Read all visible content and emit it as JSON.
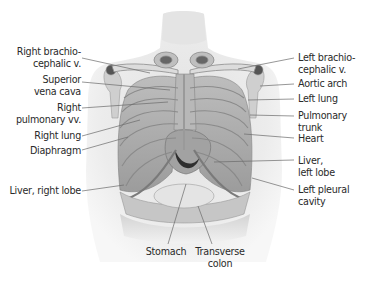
{
  "figure": {
    "type": "anatomical-illustration",
    "palette": {
      "background": "#ffffff",
      "skin": "#e9e9e9",
      "skin_shadow": "#cfcfcf",
      "bone": "#d6d6d6",
      "organ": "#a9a9a9",
      "dark": "#3b3b3b",
      "leader_line": "#6a6a6a",
      "text": "#2a2a2a"
    }
  },
  "labels_left": [
    {
      "id": "right-brachiocephalic-v",
      "lines": [
        "Right brachio-",
        "cephalic v."
      ]
    },
    {
      "id": "superior-vena-cava",
      "lines": [
        "Superior",
        "vena cava"
      ]
    },
    {
      "id": "right-pulmonary-vv",
      "lines": [
        "Right",
        "pulmonary vv."
      ]
    },
    {
      "id": "right-lung",
      "lines": [
        "Right lung"
      ]
    },
    {
      "id": "diaphragm",
      "lines": [
        "Diaphragm"
      ]
    },
    {
      "id": "liver-right-lobe",
      "lines": [
        "Liver, right lobe"
      ]
    }
  ],
  "labels_right": [
    {
      "id": "left-brachiocephalic-v",
      "lines": [
        "Left brachio-",
        "cephalic v."
      ]
    },
    {
      "id": "aortic-arch",
      "lines": [
        "Aortic arch"
      ]
    },
    {
      "id": "left-lung",
      "lines": [
        "Left lung"
      ]
    },
    {
      "id": "pulmonary-trunk",
      "lines": [
        "Pulmonary",
        "trunk"
      ]
    },
    {
      "id": "heart",
      "lines": [
        "Heart"
      ]
    },
    {
      "id": "liver-left-lobe",
      "lines": [
        "Liver,",
        "left lobe"
      ]
    },
    {
      "id": "left-pleural-cavity",
      "lines": [
        "Left pleural",
        "cavity"
      ]
    }
  ],
  "labels_bottom": [
    {
      "id": "stomach",
      "lines": [
        "Stomach"
      ]
    },
    {
      "id": "transverse-colon",
      "lines": [
        "Transverse",
        "colon"
      ]
    }
  ]
}
